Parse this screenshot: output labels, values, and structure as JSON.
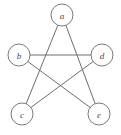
{
  "figure": {
    "kind": "graph-diagram",
    "background_color": "#ffffff",
    "edge_color": "#6e6e6e",
    "node_fill": "#ffffff",
    "node_stroke": "#7a7a7a",
    "label_color": "#4a4a4a",
    "width": 121,
    "height": 135
  },
  "graph_data": {
    "type": "undirected-graph",
    "layout": "pentagram",
    "node_radius": 11,
    "nodes": [
      {
        "id": "a",
        "label": "a",
        "x": 62,
        "y": 15
      },
      {
        "id": "b",
        "label": "b",
        "x": 19,
        "y": 55
      },
      {
        "id": "d",
        "label": "d",
        "x": 102,
        "y": 55
      },
      {
        "id": "c",
        "label": "c",
        "x": 22,
        "y": 114
      },
      {
        "id": "e",
        "label": "e",
        "x": 99,
        "y": 114
      }
    ],
    "edges": [
      {
        "from": "a",
        "to": "c"
      },
      {
        "from": "a",
        "to": "e"
      },
      {
        "from": "b",
        "to": "d"
      },
      {
        "from": "b",
        "to": "e"
      },
      {
        "from": "c",
        "to": "d"
      }
    ]
  }
}
